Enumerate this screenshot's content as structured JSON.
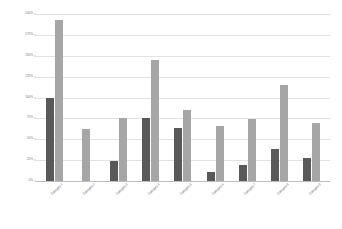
{
  "chart_data": {
    "type": "bar",
    "title": "",
    "subtitle": "",
    "xlabel": "",
    "ylabel": "",
    "ylim": [
      0,
      200
    ],
    "ytick_values": [
      0,
      25,
      50,
      75,
      100,
      125,
      150,
      175,
      200
    ],
    "ytick_labels": [
      "0%",
      "25%",
      "50%",
      "75%",
      "100%",
      "125%",
      "150%",
      "175%",
      "200%"
    ],
    "grid": true,
    "legend_position": "none",
    "categories": [
      "Category 1",
      "Category 2",
      "Category 3",
      "Category 4",
      "Category 5",
      "Category 6",
      "Category 7",
      "Category 8",
      "Category 9"
    ],
    "series": [
      {
        "name": "Series 1",
        "color": "#595959",
        "values": [
          100,
          0,
          24,
          76,
          63,
          11,
          19,
          38,
          28
        ]
      },
      {
        "name": "Series 2",
        "color": "#a6a6a6",
        "values": [
          193,
          62,
          76,
          145,
          85,
          66,
          74,
          115,
          70
        ]
      }
    ]
  },
  "colors": {
    "series_a": "#595959",
    "series_b": "#a6a6a6",
    "gridline": "#e3e3e3",
    "axis": "#bdbdbd",
    "tick_text": "#7a7a7a",
    "background": "#ffffff"
  }
}
